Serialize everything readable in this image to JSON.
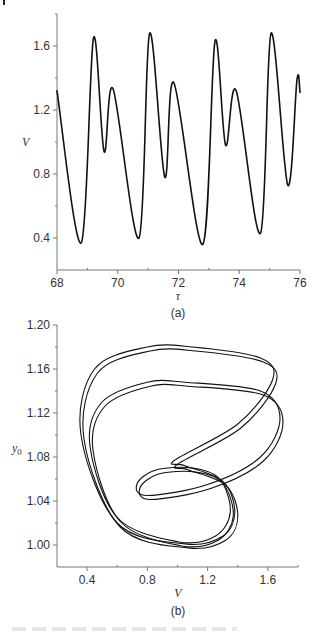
{
  "chart_data": [
    {
      "panel": "(a)",
      "type": "line",
      "title": "",
      "xlabel": "τ",
      "ylabel": "V",
      "xlim": [
        68,
        76
      ],
      "ylim": [
        0.2,
        1.8
      ],
      "xticks": [
        68,
        70,
        72,
        74,
        76
      ],
      "xtick_labels": [
        "68",
        "70",
        "72",
        "74",
        "76"
      ],
      "yticks": [
        0.4,
        0.8,
        1.2,
        1.6
      ],
      "ytick_labels": [
        "0.4",
        "0.8",
        "1.2",
        "1.6"
      ],
      "grid": false,
      "legend": null,
      "series": [
        {
          "name": "V(τ)",
          "x": [
            68.0,
            68.8,
            69.2,
            69.55,
            69.85,
            70.7,
            71.05,
            71.55,
            71.85,
            72.8,
            73.2,
            73.55,
            73.9,
            74.7,
            75.05,
            75.6,
            75.9,
            76.0
          ],
          "y": [
            1.32,
            0.37,
            1.65,
            0.94,
            1.33,
            0.4,
            1.68,
            0.78,
            1.37,
            0.36,
            1.63,
            0.98,
            1.32,
            0.43,
            1.68,
            0.73,
            1.39,
            1.31
          ]
        }
      ]
    },
    {
      "panel": "(b)",
      "type": "line",
      "title": "",
      "xlabel": "V",
      "ylabel": "y0",
      "xlim": [
        0.2,
        1.8
      ],
      "ylim": [
        0.98,
        1.2
      ],
      "xticks": [
        0.4,
        0.8,
        1.2,
        1.6
      ],
      "xtick_labels": [
        "0.4",
        "0.8",
        "1.2",
        "1.6"
      ],
      "yticks": [
        1.0,
        1.04,
        1.08,
        1.12,
        1.16,
        1.2
      ],
      "ytick_labels": [
        "1.00",
        "1.04",
        "1.08",
        "1.12",
        "1.16",
        "1.20"
      ],
      "grid": false,
      "legend": null,
      "description": "Phase portrait (V vs y0) of a period-doubled limit cycle: two outer lobes reaching y0≈1.18 and y0≈1.148, an inner loop centered near V≈0.95, y0≈1.06, bottom near y0≈1.00.",
      "series": [
        {
          "name": "trajectory",
          "x": [
            1.1,
            1.55,
            1.63,
            1.4,
            0.98,
            1.05,
            1.3,
            1.38,
            1.3,
            1.05,
            0.6,
            0.36,
            0.45,
            0.8,
            1.1
          ],
          "y": [
            1.18,
            1.17,
            1.15,
            1.11,
            1.077,
            1.072,
            1.058,
            1.03,
            1.008,
            1.001,
            1.02,
            1.1,
            1.16,
            1.18,
            1.18
          ]
        },
        {
          "name": "trajectory-2",
          "x": [
            1.05,
            1.55,
            1.68,
            1.55,
            1.2,
            0.8,
            0.73,
            0.85,
            1.1,
            1.28,
            1.35,
            1.25,
            1.0,
            0.6,
            0.42,
            0.5,
            0.8,
            1.05
          ],
          "y": [
            1.148,
            1.14,
            1.115,
            1.08,
            1.055,
            1.045,
            1.055,
            1.068,
            1.07,
            1.06,
            1.03,
            1.008,
            1.003,
            1.025,
            1.09,
            1.13,
            1.148,
            1.148
          ]
        }
      ]
    }
  ],
  "panels": {
    "a": {
      "label": "(a)",
      "xlabel": "τ",
      "ylabel": "V",
      "xtick_labels": [
        "68",
        "70",
        "72",
        "74",
        "76"
      ],
      "ytick_labels": [
        "1.6",
        "1.2",
        "0.8",
        "0.4"
      ]
    },
    "b": {
      "label": "(b)",
      "xlabel": "V",
      "ylabel_main": "y",
      "ylabel_sub": "0",
      "xtick_labels": [
        "0.4",
        "0.8",
        "1.2",
        "1.6"
      ],
      "ytick_labels": [
        "1.20",
        "1.16",
        "1.12",
        "1.08",
        "1.04",
        "1.00"
      ]
    }
  },
  "colors": {
    "curve": "#111111",
    "axis": "#777777",
    "text": "#333333"
  }
}
